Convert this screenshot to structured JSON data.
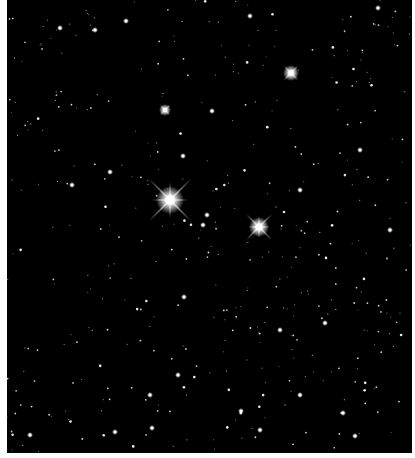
{
  "image": {
    "subject": "star field",
    "background": "#000000",
    "border": "#ffffff",
    "field": {
      "x": 7,
      "y": 0,
      "w": 405,
      "h": 453
    }
  },
  "bright_stars": [
    {
      "x": 170,
      "y": 200,
      "r": 7,
      "spike": 30,
      "cross": true
    },
    {
      "x": 259,
      "y": 227,
      "r": 5,
      "spike": 18,
      "cross": true
    },
    {
      "x": 291,
      "y": 73,
      "r": 4,
      "spike": 10,
      "cross": false
    },
    {
      "x": 165,
      "y": 110,
      "r": 3,
      "spike": 7,
      "cross": false
    }
  ],
  "medium_stars": [
    [
      95,
      30
    ],
    [
      126,
      21
    ],
    [
      212,
      111
    ],
    [
      241,
      411
    ],
    [
      207,
      215
    ],
    [
      184,
      297
    ],
    [
      72,
      185
    ],
    [
      110,
      172
    ],
    [
      203,
      225
    ],
    [
      183,
      156
    ],
    [
      250,
      16
    ],
    [
      378,
      8
    ],
    [
      60,
      28
    ],
    [
      300,
      190
    ],
    [
      360,
      150
    ],
    [
      390,
      230
    ],
    [
      150,
      395
    ],
    [
      115,
      432
    ],
    [
      355,
      436
    ],
    [
      325,
      323
    ],
    [
      178,
      375
    ],
    [
      343,
      413
    ],
    [
      300,
      395
    ],
    [
      260,
      430
    ],
    [
      152,
      428
    ],
    [
      30,
      435
    ],
    [
      280,
      330
    ]
  ],
  "small_star_seed": 7,
  "small_star_count": 420
}
